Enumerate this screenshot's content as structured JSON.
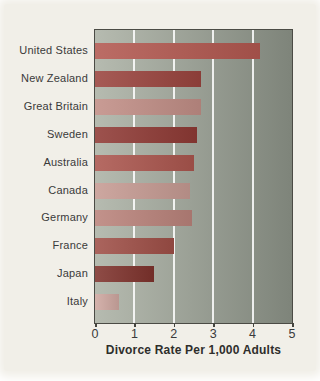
{
  "page": {
    "background": "#f1efe8",
    "scan_margin_color": "#ffffff"
  },
  "chart_data": {
    "type": "bar",
    "orientation": "horizontal",
    "title": "",
    "xlabel": "Divorce Rate Per 1,000 Adults",
    "ylabel": "",
    "categories": [
      "United States",
      "New Zealand",
      "Great Britain",
      "Sweden",
      "Australia",
      "Canada",
      "Germany",
      "France",
      "Japan",
      "Italy"
    ],
    "values": [
      4.2,
      2.7,
      2.7,
      2.6,
      2.5,
      2.4,
      2.45,
      2.0,
      1.5,
      0.6
    ],
    "bar_colors": [
      "#b25850",
      "#9a443e",
      "#c18e86",
      "#8f3a35",
      "#ab564e",
      "#c69b93",
      "#ba837b",
      "#9f4f47",
      "#7f332d",
      "#cfa8a1"
    ],
    "xlim": [
      0,
      5
    ],
    "xticks": [
      "0",
      "1",
      "2",
      "3",
      "4",
      "5"
    ],
    "gridlines_at": [
      1,
      2,
      3,
      4
    ],
    "gridline_color": "#ffffff",
    "grid": "vertical gridlines only",
    "legend": "none",
    "plot_background_left": "#b6bbb0",
    "plot_background_right": "#7e847a",
    "plot_border_color": "#4b4b45",
    "tick_mark_color": "#45453f",
    "label_color": "#3a3a3a",
    "axis_title_color": "#2e2e2c"
  }
}
